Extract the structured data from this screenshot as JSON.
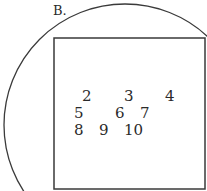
{
  "diagram": {
    "title": "B.",
    "stroke_color": "#3a3a3a",
    "universal_set": {
      "shape": "rectangle",
      "x": 54,
      "y": 38,
      "width": 152,
      "height": 151
    },
    "set_circle": {
      "shape": "circle",
      "cx": 125,
      "cy": 125,
      "r": 121
    },
    "elements": [
      {
        "label": "2",
        "x": 82,
        "y": 89
      },
      {
        "label": "3",
        "x": 124,
        "y": 89
      },
      {
        "label": "4",
        "x": 165,
        "y": 89
      },
      {
        "label": "5",
        "x": 74,
        "y": 106
      },
      {
        "label": "6",
        "x": 115,
        "y": 106
      },
      {
        "label": "7",
        "x": 140,
        "y": 106
      },
      {
        "label": "8",
        "x": 74,
        "y": 123
      },
      {
        "label": "9",
        "x": 99,
        "y": 123
      },
      {
        "label": "10",
        "x": 124,
        "y": 123
      }
    ]
  }
}
